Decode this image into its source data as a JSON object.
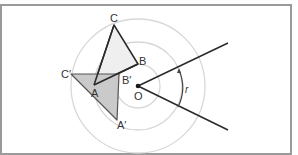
{
  "diagram": {
    "type": "rotation",
    "center": {
      "label": "O",
      "x": 138,
      "y": 86
    },
    "angle_label": "r",
    "circles_radii": [
      22,
      44,
      67
    ],
    "original_triangle": {
      "vertices": [
        {
          "label": "A",
          "x": 94,
          "y": 85
        },
        {
          "label": "B",
          "x": 138,
          "y": 64
        },
        {
          "label": "C",
          "x": 114,
          "y": 25
        }
      ],
      "fill": "#efefef"
    },
    "image_triangle": {
      "vertices": [
        {
          "label": "A′",
          "x": 117,
          "y": 120
        },
        {
          "label": "B′",
          "x": 119,
          "y": 74
        },
        {
          "label": "C′",
          "x": 71,
          "y": 74
        }
      ],
      "fill": "#c4c4c4"
    },
    "rays": [
      {
        "x1": 138,
        "y1": 86,
        "x2": 228,
        "y2": 43
      },
      {
        "x1": 138,
        "y1": 86,
        "x2": 228,
        "y2": 130
      }
    ],
    "colors": {
      "stroke": "#2a2a2a",
      "circle": "#d8d8d8",
      "frame": "#9a9a9a"
    }
  }
}
